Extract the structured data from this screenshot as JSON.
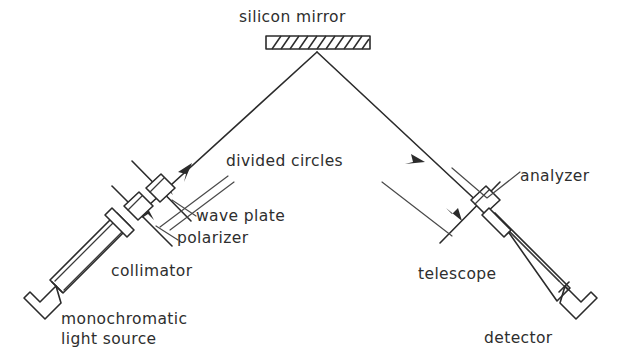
{
  "figure": {
    "type": "schematic-diagram",
    "background_color": "#ffffff",
    "ink_color": "#2b2b2b"
  },
  "labels": {
    "silicon_mirror": "silicon mirror",
    "divided_circles": "divided circles",
    "wave_plate": "wave plate",
    "polarizer": "polarizer",
    "collimator": "collimator",
    "monochromatic_light_source_line1": "monochromatic",
    "monochromatic_light_source_line2": "light source",
    "analyzer": "analyzer",
    "telescope": "telescope",
    "detector": "detector"
  },
  "components": [
    {
      "name": "silicon-mirror",
      "label": "silicon mirror",
      "shape": "hatched-bar",
      "position": "top-center"
    },
    {
      "name": "monochromatic-light-source",
      "label": "monochromatic light source",
      "shape": "open-bracket",
      "position": "bottom-left"
    },
    {
      "name": "collimator",
      "label": "collimator",
      "shape": "tube",
      "position": "left"
    },
    {
      "name": "polarizer",
      "label": "polarizer",
      "shape": "parallelogram",
      "position": "left-axis"
    },
    {
      "name": "wave-plate",
      "label": "wave plate",
      "shape": "parallelogram",
      "position": "left-axis"
    },
    {
      "name": "divided-circles",
      "label": "divided circles",
      "shape": "cross-line",
      "position": "both-arms"
    },
    {
      "name": "analyzer",
      "label": "analyzer",
      "shape": "parallelogram",
      "position": "right-axis"
    },
    {
      "name": "telescope",
      "label": "telescope",
      "shape": "tube",
      "position": "right"
    },
    {
      "name": "detector",
      "label": "detector",
      "shape": "open-bracket",
      "position": "bottom-right"
    }
  ],
  "beam_path": {
    "incident_arrow_direction": "up-right",
    "reflected_arrow_direction": "down-right",
    "vertex": "silicon mirror"
  }
}
